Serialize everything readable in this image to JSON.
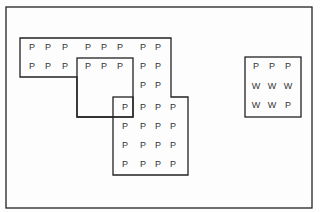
{
  "diagram": {
    "frame": {
      "x": 6,
      "y": 7,
      "w": 306,
      "h": 201
    },
    "colors": {
      "line": "#222222",
      "text": "#333333",
      "background": "#fdfdfd"
    },
    "shapes": [
      {
        "name": "large-region",
        "points": "20,38 171,38 171,97 188,97 188,175 113,175 113,117 77,117 77,77 20,77"
      },
      {
        "name": "middle-rect",
        "rect": [
          77,
          58,
          56,
          59
        ]
      },
      {
        "name": "overlap-square",
        "rect": [
          113,
          97,
          20,
          20
        ]
      },
      {
        "name": "small-box",
        "rect": [
          245,
          57,
          56,
          60
        ]
      }
    ],
    "labels": [
      {
        "t": "P",
        "x": 32,
        "y": 47
      },
      {
        "t": "P",
        "x": 48,
        "y": 47
      },
      {
        "t": "P",
        "x": 65,
        "y": 47
      },
      {
        "t": "P",
        "x": 88,
        "y": 47
      },
      {
        "t": "P",
        "x": 104,
        "y": 47
      },
      {
        "t": "P",
        "x": 120,
        "y": 47
      },
      {
        "t": "P",
        "x": 143,
        "y": 47
      },
      {
        "t": "P",
        "x": 158,
        "y": 47
      },
      {
        "t": "P",
        "x": 32,
        "y": 66
      },
      {
        "t": "P",
        "x": 48,
        "y": 66
      },
      {
        "t": "P",
        "x": 65,
        "y": 66
      },
      {
        "t": "P",
        "x": 88,
        "y": 66
      },
      {
        "t": "P",
        "x": 104,
        "y": 66
      },
      {
        "t": "P",
        "x": 120,
        "y": 66
      },
      {
        "t": "P",
        "x": 143,
        "y": 66
      },
      {
        "t": "P",
        "x": 158,
        "y": 66
      },
      {
        "t": "P",
        "x": 143,
        "y": 85
      },
      {
        "t": "P",
        "x": 158,
        "y": 85
      },
      {
        "t": "P",
        "x": 125,
        "y": 107
      },
      {
        "t": "P",
        "x": 143,
        "y": 107
      },
      {
        "t": "P",
        "x": 158,
        "y": 107
      },
      {
        "t": "P",
        "x": 173,
        "y": 107
      },
      {
        "t": "P",
        "x": 125,
        "y": 126
      },
      {
        "t": "P",
        "x": 143,
        "y": 126
      },
      {
        "t": "P",
        "x": 158,
        "y": 126
      },
      {
        "t": "P",
        "x": 173,
        "y": 126
      },
      {
        "t": "P",
        "x": 125,
        "y": 145
      },
      {
        "t": "P",
        "x": 143,
        "y": 145
      },
      {
        "t": "P",
        "x": 158,
        "y": 145
      },
      {
        "t": "P",
        "x": 173,
        "y": 145
      },
      {
        "t": "P",
        "x": 125,
        "y": 164
      },
      {
        "t": "P",
        "x": 143,
        "y": 164
      },
      {
        "t": "P",
        "x": 158,
        "y": 164
      },
      {
        "t": "P",
        "x": 173,
        "y": 164
      },
      {
        "t": "P",
        "x": 256,
        "y": 66
      },
      {
        "t": "P",
        "x": 272,
        "y": 66
      },
      {
        "t": "P",
        "x": 288,
        "y": 66
      },
      {
        "t": "W",
        "x": 256,
        "y": 86
      },
      {
        "t": "W",
        "x": 272,
        "y": 86
      },
      {
        "t": "W",
        "x": 288,
        "y": 86
      },
      {
        "t": "W",
        "x": 256,
        "y": 105
      },
      {
        "t": "W",
        "x": 272,
        "y": 105
      },
      {
        "t": "P",
        "x": 288,
        "y": 105
      }
    ]
  }
}
